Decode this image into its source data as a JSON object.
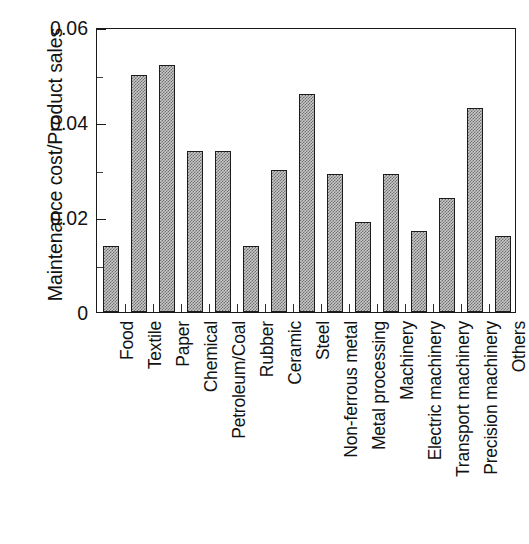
{
  "chart_data": {
    "type": "bar",
    "title": "",
    "xlabel": "",
    "ylabel": "Maintenance cost/Product sales",
    "ylim": [
      0,
      0.06
    ],
    "yticks": [
      0,
      0.02,
      0.04,
      0.06
    ],
    "ytick_labels": [
      "0",
      "0.02",
      "0.04",
      "0.06"
    ],
    "yminor_ticks": [
      0.01,
      0.03,
      0.05
    ],
    "grid": false,
    "legend": null,
    "categories": [
      "Food",
      "Textile",
      "Paper",
      "Chemical",
      "Petroleum/Coal",
      "Rubber",
      "Ceramic",
      "Steel",
      "Non-ferrous metal",
      "Metal processing",
      "Machinery",
      "Electric machinery",
      "Transport machinery",
      "Precision machinery",
      "Others"
    ],
    "values": [
      0.014,
      0.05,
      0.052,
      0.034,
      0.034,
      0.014,
      0.03,
      0.046,
      0.029,
      0.019,
      0.029,
      0.017,
      0.024,
      0.043,
      0.016
    ],
    "bar_fill": "#c9c9c9",
    "bar_pattern": "checkerboard-stipple",
    "bar_edge_color": "#1c1c1c",
    "axis_color": "#1a1a1a"
  }
}
